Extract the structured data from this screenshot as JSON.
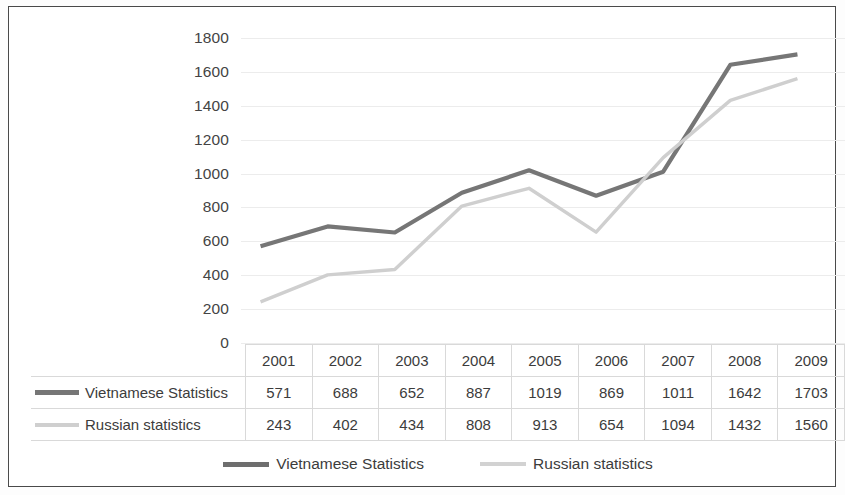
{
  "chart_data": {
    "type": "line",
    "title": "",
    "xlabel": "",
    "ylabel": "",
    "categories": [
      "2001",
      "2002",
      "2003",
      "2004",
      "2005",
      "2006",
      "2007",
      "2008",
      "2009"
    ],
    "series": [
      {
        "name": "Vietnamese Statistics",
        "color": "#767676",
        "values": [
          571,
          688,
          652,
          887,
          1019,
          869,
          1011,
          1642,
          1703
        ]
      },
      {
        "name": "Russian statistics",
        "color": "#cfcfcf",
        "values": [
          243,
          402,
          434,
          808,
          913,
          654,
          1094,
          1432,
          1560
        ]
      }
    ],
    "ylim": [
      0,
      1800
    ],
    "ytick_step": 200,
    "yticks": [
      "1800",
      "1600",
      "1400",
      "1200",
      "1000",
      "800",
      "600",
      "400",
      "200",
      "0"
    ],
    "grid": true,
    "legend_position": "bottom"
  },
  "table": {
    "row_label_header": "",
    "year_headers": [
      "2001",
      "2002",
      "2003",
      "2004",
      "2005",
      "2006",
      "2007",
      "2008",
      "2009"
    ],
    "rows": [
      {
        "label": "Vietnamese Statistics",
        "swatch": "vn",
        "cells": [
          "571",
          "688",
          "652",
          "887",
          "1019",
          "869",
          "1011",
          "1642",
          "1703"
        ]
      },
      {
        "label": "Russian statistics",
        "swatch": "ru",
        "cells": [
          "243",
          "402",
          "434",
          "808",
          "913",
          "654",
          "1094",
          "1432",
          "1560"
        ]
      }
    ]
  },
  "legend": {
    "items": [
      {
        "label": "Vietnamese Statistics",
        "swatch": "vn"
      },
      {
        "label": "Russian statistics",
        "swatch": "ru"
      }
    ]
  }
}
